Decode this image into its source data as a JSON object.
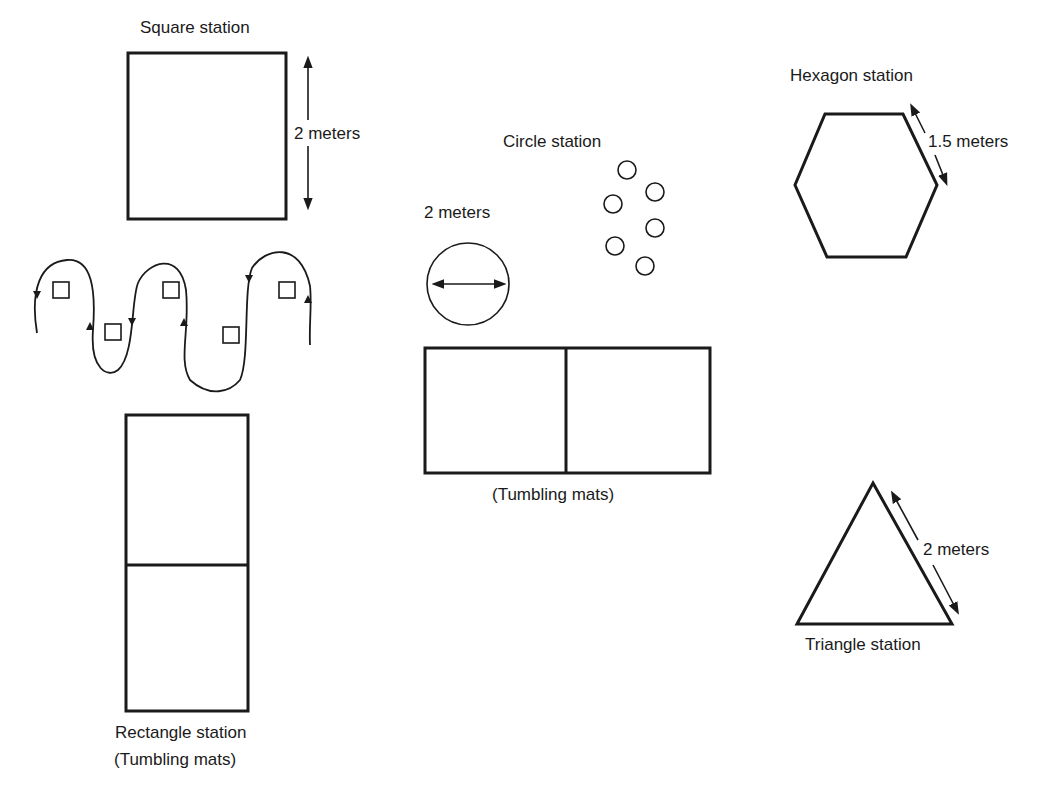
{
  "diagram": {
    "type": "gym station layout",
    "stations": [
      {
        "id": "square",
        "label": "Square station",
        "dimension": "2 meters"
      },
      {
        "id": "rectangle",
        "label": "Rectangle station",
        "sublabel": "(Tumbling mats)"
      },
      {
        "id": "circle",
        "label": "Circle station",
        "dimension": "2 meters"
      },
      {
        "id": "center_mats",
        "label": "(Tumbling mats)"
      },
      {
        "id": "hexagon",
        "label": "Hexagon station",
        "dimension": "1.5 meters"
      },
      {
        "id": "triangle",
        "label": "Triangle station",
        "dimension": "2 meters"
      }
    ],
    "slalom": {
      "description": "winding path around 6 small squares",
      "marker_count": 6
    },
    "circle_markers": {
      "count": 6
    }
  },
  "labels": {
    "square_title": "Square station",
    "square_dim": "2 meters",
    "rect_title": "Rectangle station",
    "rect_sub": "(Tumbling mats)",
    "circle_title": "Circle station",
    "circle_dim": "2 meters",
    "center_mats": "(Tumbling mats)",
    "hex_title": "Hexagon station",
    "hex_dim": "1.5 meters",
    "tri_title": "Triangle station",
    "tri_dim": "2 meters"
  },
  "colors": {
    "ink": "#1a1a1a",
    "background": "#ffffff"
  }
}
